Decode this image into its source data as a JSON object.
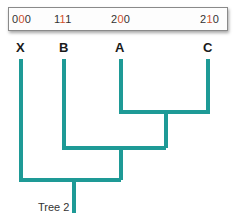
{
  "character_states": {
    "items": [
      {
        "taxon": "X",
        "code": "000",
        "d1": "0",
        "d2": "0",
        "d3": "0"
      },
      {
        "taxon": "B",
        "code": "111",
        "d1": "1",
        "d2": "1",
        "d3": "1"
      },
      {
        "taxon": "A",
        "code": "200",
        "d1": "2",
        "d2": "0",
        "d3": "0"
      },
      {
        "taxon": "C",
        "code": "210",
        "d1": "2",
        "d2": "1",
        "d3": "0"
      }
    ],
    "highlight_color": "#d4512a"
  },
  "taxa": [
    "X",
    "B",
    "A",
    "C"
  ],
  "tree": {
    "label": "Tree 2",
    "line_color": "#1e9a96",
    "topology": "(X,(B,(A,C)))"
  }
}
